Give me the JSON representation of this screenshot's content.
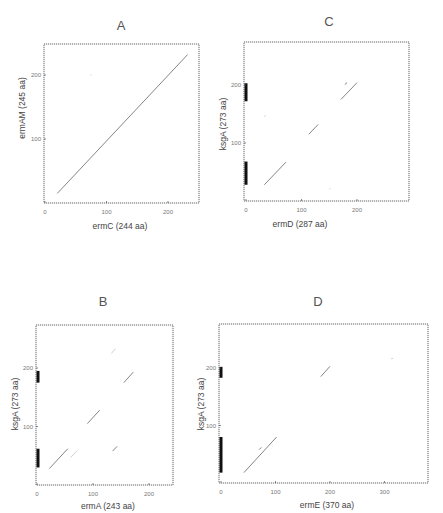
{
  "figure": {
    "panels": [
      {
        "id": "A",
        "title": "A",
        "xlabel": "ermC (244 aa)",
        "ylabel": "ermAM (245 aa)"
      },
      {
        "id": "C",
        "title": "C",
        "xlabel": "ermD (287 aa)",
        "ylabel": "ksgA (273 aa)"
      },
      {
        "id": "B",
        "title": "B",
        "xlabel": "ermA (243 aa)",
        "ylabel": "ksgA (273 aa)"
      },
      {
        "id": "D",
        "title": "D",
        "xlabel": "ermE (370 aa)",
        "ylabel": "ksgA (273 aa)"
      }
    ]
  },
  "chart_data": [
    {
      "type": "scatter",
      "panel": "A",
      "title": "A",
      "xlabel": "ermC (244 aa)",
      "ylabel": "ermAM (245 aa)",
      "xlim": [
        0,
        250
      ],
      "ylim": [
        0,
        245
      ],
      "xticks": [
        0,
        100,
        200
      ],
      "yticks": [
        100,
        200
      ],
      "segments": [
        {
          "x1": 20,
          "y1": 15,
          "x2": 232,
          "y2": 232,
          "strength": "medium"
        },
        {
          "x1": 74,
          "y1": 199,
          "x2": 76,
          "y2": 201,
          "strength": "faint"
        }
      ],
      "motif_bars": []
    },
    {
      "type": "scatter",
      "panel": "C",
      "title": "C",
      "xlabel": "ermD (287 aa)",
      "ylabel": "ksgA (273 aa)",
      "xlim": [
        0,
        290
      ],
      "ylim": [
        0,
        273
      ],
      "xticks": [
        0,
        100,
        200
      ],
      "yticks": [
        100,
        200
      ],
      "segments": [
        {
          "x1": 33,
          "y1": 28,
          "x2": 72,
          "y2": 67,
          "strength": "medium"
        },
        {
          "x1": 113,
          "y1": 115,
          "x2": 130,
          "y2": 132,
          "strength": "medium"
        },
        {
          "x1": 171,
          "y1": 175,
          "x2": 200,
          "y2": 204,
          "strength": "medium"
        },
        {
          "x1": 178,
          "y1": 201,
          "x2": 182,
          "y2": 204,
          "strength": "medium"
        },
        {
          "x1": 33,
          "y1": 145,
          "x2": 36,
          "y2": 148,
          "strength": "faint"
        },
        {
          "x1": 150,
          "y1": 20,
          "x2": 152,
          "y2": 22,
          "strength": "faint"
        }
      ],
      "motif_bars": [
        {
          "y1": 28,
          "y2": 68
        },
        {
          "y1": 172,
          "y2": 203
        }
      ]
    },
    {
      "type": "scatter",
      "panel": "B",
      "title": "B",
      "xlabel": "ermA (243 aa)",
      "ylabel": "ksgA (273 aa)",
      "xlim": [
        0,
        245
      ],
      "ylim": [
        0,
        273
      ],
      "xticks": [
        0,
        100,
        200
      ],
      "yticks": [
        100,
        200
      ],
      "segments": [
        {
          "x1": 22,
          "y1": 28,
          "x2": 55,
          "y2": 62,
          "strength": "medium"
        },
        {
          "x1": 60,
          "y1": 47,
          "x2": 72,
          "y2": 59,
          "strength": "faint"
        },
        {
          "x1": 90,
          "y1": 105,
          "x2": 112,
          "y2": 128,
          "strength": "medium"
        },
        {
          "x1": 135,
          "y1": 58,
          "x2": 143,
          "y2": 66,
          "strength": "medium"
        },
        {
          "x1": 155,
          "y1": 175,
          "x2": 172,
          "y2": 193,
          "strength": "medium"
        },
        {
          "x1": 133,
          "y1": 225,
          "x2": 140,
          "y2": 233,
          "strength": "faint"
        }
      ],
      "motif_bars": [
        {
          "y1": 30,
          "y2": 62
        },
        {
          "y1": 175,
          "y2": 195
        }
      ]
    },
    {
      "type": "scatter",
      "panel": "D",
      "title": "D",
      "xlabel": "ermE (370 aa)",
      "ylabel": "ksgA (273 aa)",
      "xlim": [
        0,
        372
      ],
      "ylim": [
        0,
        273
      ],
      "xticks": [
        0,
        100,
        200,
        300
      ],
      "yticks": [
        100,
        200
      ],
      "segments": [
        {
          "x1": 42,
          "y1": 18,
          "x2": 102,
          "y2": 80,
          "strength": "medium"
        },
        {
          "x1": 70,
          "y1": 58,
          "x2": 74,
          "y2": 62,
          "strength": "medium"
        },
        {
          "x1": 183,
          "y1": 185,
          "x2": 200,
          "y2": 203,
          "strength": "medium"
        },
        {
          "x1": 312,
          "y1": 216,
          "x2": 316,
          "y2": 217,
          "strength": "faint"
        }
      ],
      "motif_bars": [
        {
          "y1": 18,
          "y2": 80
        },
        {
          "y1": 183,
          "y2": 202
        }
      ]
    }
  ]
}
